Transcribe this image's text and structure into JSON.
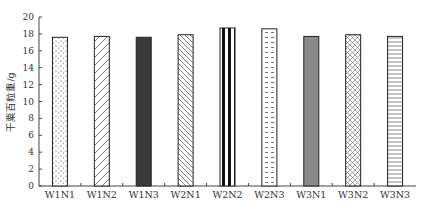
{
  "chart_data": {
    "type": "bar",
    "title": "",
    "xlabel": "",
    "ylabel": "干粟百粒重/g",
    "ylim": [
      0,
      20
    ],
    "yticks": [
      0,
      2,
      4,
      6,
      8,
      10,
      12,
      14,
      16,
      18,
      20
    ],
    "grid": false,
    "categories": [
      "W1N1",
      "W1N2",
      "W1N3",
      "W2N1",
      "W2N2",
      "W2N3",
      "W3N1",
      "W3N2",
      "W3N3"
    ],
    "values": [
      17.6,
      17.7,
      17.6,
      17.9,
      18.7,
      18.6,
      17.7,
      17.9,
      17.7
    ],
    "patterns": [
      "dots",
      "diag-up",
      "solid-dark",
      "diag-down",
      "vertical-bold",
      "dashes",
      "solid-gray",
      "crosshatch",
      "horizontal"
    ]
  }
}
